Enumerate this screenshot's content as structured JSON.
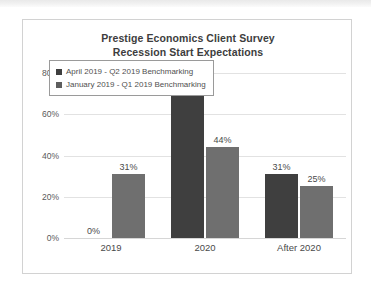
{
  "chart_data": {
    "type": "bar",
    "title": "Prestige Economics Client Survey Recession Start Expectations",
    "title_line1": "Prestige Economics Client Survey",
    "title_line2": "Recession Start Expectations",
    "xlabel": "",
    "ylabel": "",
    "categories": [
      "2019",
      "2020",
      "After 2020"
    ],
    "series": [
      {
        "name": "April 2019 - Q2 2019 Benchmarking",
        "color": "#3f3f3f",
        "values": [
          0,
          69,
          31
        ],
        "labels": [
          "0%",
          "69%",
          "31%"
        ]
      },
      {
        "name": "January 2019 - Q1 2019 Benchmarking",
        "color": "#6f6f6f",
        "values": [
          31,
          44,
          25
        ],
        "labels": [
          "31%",
          "44%",
          "25%"
        ]
      }
    ],
    "ylim": [
      0,
      80
    ],
    "yticks": [
      0,
      20,
      40,
      60,
      80
    ],
    "ytick_labels": [
      "0%",
      "20%",
      "40%",
      "60%",
      "80%"
    ],
    "grid": true,
    "legend_position": "top-left"
  },
  "legend": {
    "items": [
      {
        "label": "April 2019 - Q2 2019 Benchmarking",
        "marker": "legend-swatch-icon"
      },
      {
        "label": "January 2019 - Q1 2019 Benchmarking",
        "marker": "legend-swatch-icon"
      }
    ]
  }
}
